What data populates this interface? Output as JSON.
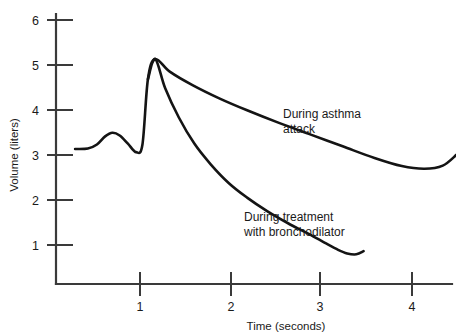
{
  "chart_data": {
    "type": "line",
    "title": "",
    "xlabel": "Time (seconds)",
    "ylabel": "Volume (liters)",
    "xlim": [
      0.0,
      4.5
    ],
    "ylim": [
      0.0,
      6.4
    ],
    "xticks": [
      1,
      2,
      3,
      4
    ],
    "yticks": [
      1,
      2,
      3,
      4,
      5,
      6
    ],
    "xtick_labels": [
      "1",
      "2",
      "3",
      "4"
    ],
    "ytick_labels": [
      "1",
      "2",
      "3",
      "4",
      "5",
      "6"
    ],
    "grid": false,
    "legend": "annotations-inline",
    "line_color": "#141414",
    "axis_color": "#3a3a3a",
    "background": "#ffffff",
    "series": [
      {
        "name": "During asthma attack",
        "annotation": "During asthma attack",
        "annotation_lines": [
          "During asthma",
          "attack"
        ],
        "x": [
          0.21,
          0.35,
          0.45,
          0.54,
          0.62,
          0.7,
          0.79,
          0.88,
          0.95,
          1.01,
          1.09,
          1.25,
          1.5,
          1.8,
          2.1,
          2.45,
          2.8,
          3.15,
          3.5,
          3.8,
          4.05,
          4.25,
          4.4
        ],
        "y": [
          3.0,
          3.01,
          3.1,
          3.28,
          3.36,
          3.3,
          3.12,
          2.93,
          3.1,
          4.55,
          5.0,
          4.72,
          4.42,
          4.12,
          3.86,
          3.58,
          3.32,
          3.06,
          2.8,
          2.62,
          2.56,
          2.63,
          2.87
        ]
      },
      {
        "name": "During treatment with bronchodilator",
        "annotation": "During treatment with bronchodilator",
        "annotation_lines": [
          "During treatment",
          "with bronchodilator"
        ],
        "x": [
          1.01,
          1.09,
          1.2,
          1.35,
          1.52,
          1.7,
          1.9,
          2.1,
          2.32,
          2.55,
          2.75,
          2.95,
          3.1,
          3.2,
          3.3,
          3.38
        ],
        "y": [
          4.55,
          5.0,
          4.35,
          3.7,
          3.12,
          2.66,
          2.24,
          1.92,
          1.62,
          1.35,
          1.14,
          0.92,
          0.76,
          0.68,
          0.66,
          0.73
        ]
      }
    ],
    "annotations": [
      {
        "text_lines": [
          "During asthma",
          "attack"
        ],
        "x_px": 283,
        "y_px": 118
      },
      {
        "text_lines": [
          "During treatment",
          "with bronchodilator"
        ],
        "x_px": 244,
        "y_px": 221
      }
    ]
  }
}
